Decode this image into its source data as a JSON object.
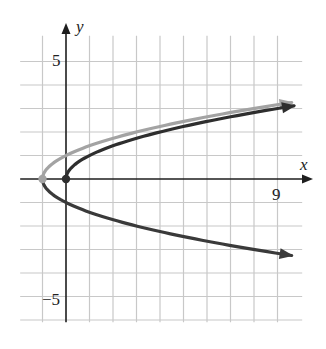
{
  "chart_data": {
    "type": "line",
    "title": "",
    "xlabel": "x",
    "ylabel": "y",
    "xlim": [
      -2,
      10
    ],
    "ylim": [
      -6,
      6
    ],
    "grid": true,
    "grid_step": 1,
    "tick_labels": {
      "x": [
        {
          "value": 9,
          "label": "9"
        }
      ],
      "y": [
        {
          "value": 5,
          "label": "5"
        },
        {
          "value": -5,
          "label": "−5"
        }
      ]
    },
    "series": [
      {
        "name": "x = y^2 - 1 (upper branch)",
        "color": "#a3a3a3",
        "equation": "x = y^2 - 1, y >= 0",
        "vertex": [
          -1,
          0
        ],
        "arrow_end": [
          10,
          3.32
        ]
      },
      {
        "name": "x = y^2 - 1 (lower branch)",
        "color": "#3a3a3a",
        "equation": "x = y^2 - 1, y <= 0",
        "vertex": [
          -1,
          0
        ],
        "arrow_end": [
          10,
          -3.32
        ]
      },
      {
        "name": "x = y^2 (upper branch)",
        "color": "#2e2e2e",
        "equation": "x = y^2, y >= 0",
        "vertex": [
          0,
          0
        ],
        "arrow_end": [
          10,
          3.16
        ]
      }
    ],
    "points": [
      {
        "x": -1,
        "y": 0,
        "color": "#a3a3a3"
      },
      {
        "x": 0,
        "y": 0,
        "color": "#2e2e2e"
      }
    ]
  },
  "labels": {
    "x_axis": "x",
    "y_axis": "y",
    "tick_x_9": "9",
    "tick_y_5": "5",
    "tick_y_neg5": "−5"
  },
  "colors": {
    "grid": "#c8c8c8",
    "axis": "#1e1e1e",
    "light_curve": "#a3a3a3",
    "dark_curve": "#333333"
  }
}
